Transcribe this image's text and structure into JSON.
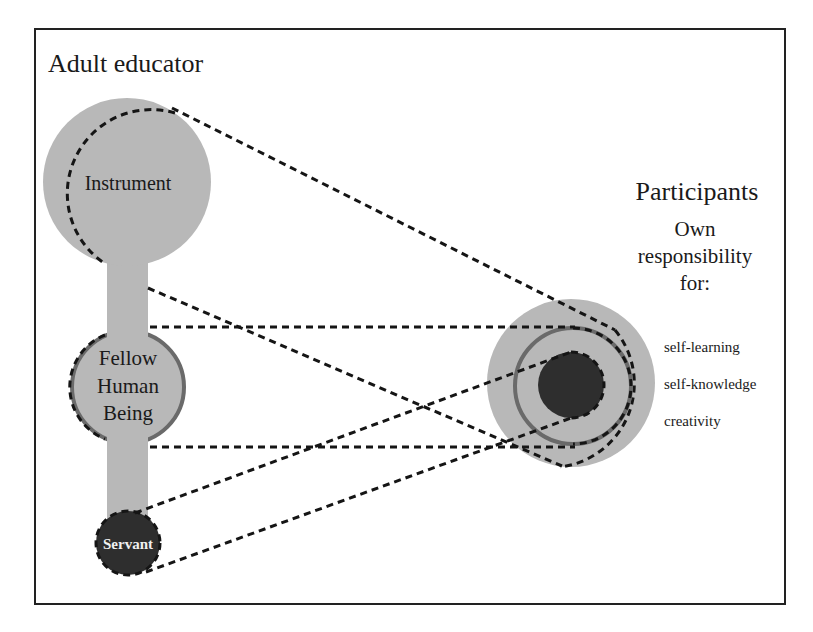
{
  "diagram": {
    "title": "Adult educator",
    "educator_roles": {
      "instrument": "Instrument",
      "fellow_line1": "Fellow",
      "fellow_line2": "Human",
      "fellow_line3": "Being",
      "servant": "Servant"
    },
    "participants": {
      "heading": "Participants",
      "sub_line1": "Own",
      "sub_line2": "responsibility",
      "sub_line3": "for:",
      "items": [
        "self-learning",
        "self-knowledge",
        "creativity"
      ]
    },
    "colors": {
      "light_gray": "#b8b8b8",
      "ring_gray": "#6a6a6a",
      "dark_fill": "#2e2e2e",
      "dash": "#151515",
      "frame": "#222222"
    }
  }
}
